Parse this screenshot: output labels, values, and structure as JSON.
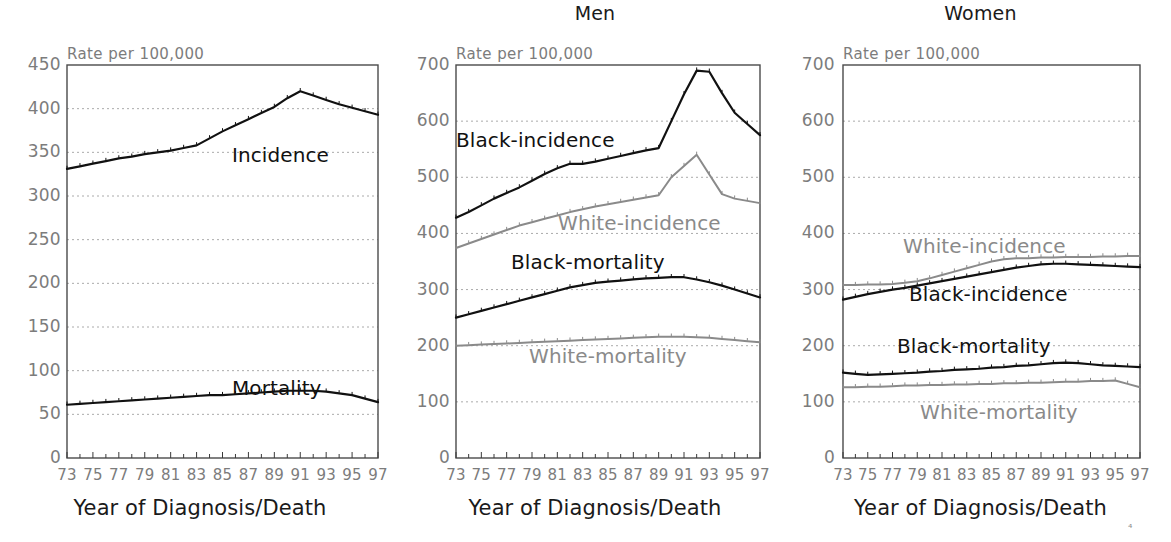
{
  "figure": {
    "axis_title": "Year of Diagnosis/Death",
    "rate_label": "Rate per 100,000",
    "colors": {
      "black_series": "#111111",
      "white_series": "#8a8a8a",
      "tick_text": "#7c7c7c",
      "axis": "#555555",
      "grid": "#aaaaaa"
    }
  },
  "panels": [
    {
      "id": "overall",
      "title": "",
      "rate_label": "Rate per 100,000",
      "xlabel": "Year of Diagnosis/Death",
      "yticks": [
        "0",
        "50",
        "100",
        "150",
        "200",
        "250",
        "300",
        "350",
        "400",
        "450"
      ],
      "xticks": [
        "73",
        "75",
        "77",
        "79",
        "81",
        "83",
        "85",
        "87",
        "89",
        "91",
        "93",
        "95",
        "97"
      ],
      "series_labels": [
        {
          "text": "Incidence",
          "tone": "black"
        },
        {
          "text": "Mortality",
          "tone": "black"
        }
      ]
    },
    {
      "id": "men",
      "title": "Men",
      "rate_label": "Rate per 100,000",
      "xlabel": "Year of Diagnosis/Death",
      "yticks": [
        "0",
        "100",
        "200",
        "300",
        "400",
        "500",
        "600",
        "700"
      ],
      "xticks": [
        "73",
        "75",
        "77",
        "79",
        "81",
        "83",
        "85",
        "87",
        "89",
        "91",
        "93",
        "95",
        "97"
      ],
      "series_labels": [
        {
          "text": "Black-incidence",
          "tone": "black"
        },
        {
          "text": "White-incidence",
          "tone": "white"
        },
        {
          "text": "Black-mortality",
          "tone": "black"
        },
        {
          "text": "White-mortality",
          "tone": "white"
        }
      ]
    },
    {
      "id": "women",
      "title": "Women",
      "rate_label": "Rate per 100,000",
      "xlabel": "Year of Diagnosis/Death",
      "yticks": [
        "0",
        "100",
        "200",
        "300",
        "400",
        "500",
        "600",
        "700"
      ],
      "xticks": [
        "73",
        "75",
        "77",
        "79",
        "81",
        "83",
        "85",
        "87",
        "89",
        "91",
        "93",
        "95",
        "97"
      ],
      "series_labels": [
        {
          "text": "White-incidence",
          "tone": "white"
        },
        {
          "text": "Black-incidence",
          "tone": "black"
        },
        {
          "text": "Black-mortality",
          "tone": "black"
        },
        {
          "text": "White-mortality",
          "tone": "white"
        }
      ]
    }
  ],
  "chart_data": [
    {
      "type": "line",
      "title": "",
      "xlabel": "Year of Diagnosis/Death",
      "ylabel": "Rate per 100,000",
      "xlim": [
        73,
        97
      ],
      "ylim": [
        0,
        450
      ],
      "ytick_step": 50,
      "grid": true,
      "legend_position": "inline-annotation",
      "x": [
        73,
        74,
        75,
        76,
        77,
        78,
        79,
        80,
        81,
        82,
        83,
        84,
        85,
        86,
        87,
        88,
        89,
        90,
        91,
        92,
        93,
        94,
        95,
        96,
        97
      ],
      "series": [
        {
          "name": "Incidence",
          "color": "#111111",
          "values": [
            331,
            334,
            337,
            340,
            343,
            345,
            348,
            350,
            352,
            355,
            358,
            366,
            374,
            381,
            388,
            395,
            402,
            412,
            420,
            415,
            410,
            405,
            401,
            397,
            393
          ]
        },
        {
          "name": "Mortality",
          "color": "#111111",
          "values": [
            61,
            62,
            63,
            64,
            65,
            66,
            67,
            68,
            69,
            70,
            71,
            72,
            72,
            73,
            74,
            75,
            76,
            77,
            77,
            77,
            76,
            74,
            72,
            68,
            64
          ]
        }
      ]
    },
    {
      "type": "line",
      "title": "Men",
      "xlabel": "Year of Diagnosis/Death",
      "ylabel": "Rate per 100,000",
      "xlim": [
        73,
        97
      ],
      "ylim": [
        0,
        700
      ],
      "ytick_step": 100,
      "grid": true,
      "legend_position": "inline-annotation",
      "x": [
        73,
        74,
        75,
        76,
        77,
        78,
        79,
        80,
        81,
        82,
        83,
        84,
        85,
        86,
        87,
        88,
        89,
        90,
        91,
        92,
        93,
        94,
        95,
        96,
        97
      ],
      "series": [
        {
          "name": "Black-incidence",
          "color": "#111111",
          "values": [
            428,
            438,
            450,
            462,
            472,
            482,
            494,
            506,
            516,
            524,
            524,
            528,
            533,
            538,
            543,
            548,
            552,
            600,
            648,
            690,
            688,
            650,
            615,
            595,
            575
          ]
        },
        {
          "name": "White-incidence",
          "color": "#8a8a8a",
          "values": [
            374,
            382,
            390,
            398,
            406,
            414,
            420,
            426,
            432,
            438,
            443,
            448,
            452,
            456,
            460,
            464,
            468,
            500,
            520,
            540,
            505,
            470,
            462,
            458,
            454
          ]
        },
        {
          "name": "Black-mortality",
          "color": "#111111",
          "values": [
            250,
            256,
            262,
            268,
            274,
            280,
            286,
            292,
            298,
            304,
            308,
            312,
            314,
            316,
            318,
            320,
            321,
            322,
            322,
            318,
            313,
            307,
            300,
            293,
            286
          ]
        },
        {
          "name": "White-mortality",
          "color": "#8a8a8a",
          "values": [
            200,
            201,
            202,
            203,
            204,
            205,
            206,
            207,
            208,
            209,
            210,
            211,
            212,
            213,
            214,
            215,
            216,
            216,
            216,
            215,
            214,
            212,
            210,
            208,
            206
          ]
        }
      ]
    },
    {
      "type": "line",
      "title": "Women",
      "xlabel": "Year of Diagnosis/Death",
      "ylabel": "Rate per 100,000",
      "xlim": [
        73,
        97
      ],
      "ylim": [
        0,
        700
      ],
      "ytick_step": 100,
      "grid": true,
      "legend_position": "inline-annotation",
      "x": [
        73,
        74,
        75,
        76,
        77,
        78,
        79,
        80,
        81,
        82,
        83,
        84,
        85,
        86,
        87,
        88,
        89,
        90,
        91,
        92,
        93,
        94,
        95,
        96,
        97
      ],
      "series": [
        {
          "name": "White-incidence",
          "color": "#8a8a8a",
          "values": [
            308,
            308,
            309,
            309,
            310,
            312,
            315,
            320,
            326,
            332,
            338,
            344,
            350,
            354,
            356,
            356,
            357,
            357,
            358,
            358,
            358,
            359,
            359,
            360,
            360
          ]
        },
        {
          "name": "Black-incidence",
          "color": "#111111",
          "values": [
            282,
            287,
            292,
            296,
            300,
            303,
            307,
            311,
            315,
            319,
            323,
            327,
            331,
            335,
            339,
            342,
            345,
            346,
            346,
            345,
            344,
            343,
            342,
            341,
            340
          ]
        },
        {
          "name": "Black-mortality",
          "color": "#111111",
          "values": [
            152,
            150,
            148,
            149,
            150,
            151,
            152,
            154,
            155,
            157,
            158,
            159,
            161,
            162,
            164,
            165,
            167,
            169,
            170,
            169,
            167,
            165,
            164,
            163,
            162
          ]
        },
        {
          "name": "White-mortality",
          "color": "#8a8a8a",
          "values": [
            126,
            126,
            127,
            127,
            128,
            129,
            129,
            130,
            130,
            131,
            131,
            132,
            132,
            133,
            133,
            134,
            134,
            135,
            136,
            136,
            137,
            137,
            138,
            132,
            126
          ]
        }
      ]
    }
  ]
}
